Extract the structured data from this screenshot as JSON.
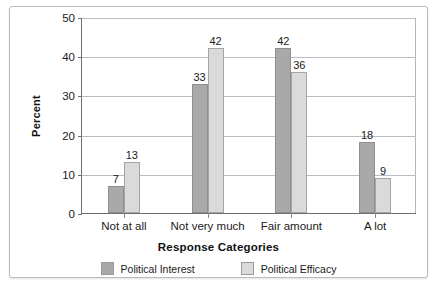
{
  "chart_data": {
    "type": "bar",
    "title": "",
    "xlabel": "Response Categories",
    "ylabel": "Percent",
    "categories": [
      "Not at all",
      "Not very much",
      "Fair amount",
      "A lot"
    ],
    "series": [
      {
        "name": "Political Interest",
        "color": "#a9a9a9",
        "values": [
          7,
          33,
          42,
          18
        ]
      },
      {
        "name": "Political Efficacy",
        "color": "#dadada",
        "values": [
          13,
          42,
          36,
          9
        ]
      }
    ],
    "ylim": [
      0,
      50
    ],
    "yticks": [
      0,
      10,
      20,
      30,
      40,
      50
    ],
    "ytick_labels": [
      "0",
      "10",
      "20",
      "30",
      "40",
      "50"
    ],
    "grid": true,
    "legend_position": "bottom"
  },
  "axis": {
    "y_title": "Percent",
    "x_title": "Response Categories"
  },
  "legend": {
    "items": [
      {
        "label": "Political Interest",
        "color": "#a9a9a9"
      },
      {
        "label": "Political Efficacy",
        "color": "#dadada"
      }
    ]
  }
}
